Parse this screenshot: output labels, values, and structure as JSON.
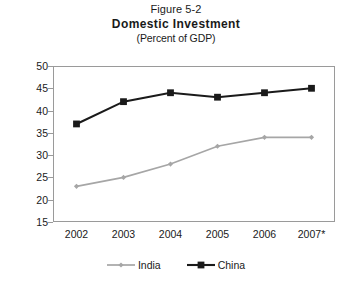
{
  "titles": {
    "figure_number": "Figure 5-2",
    "main": "Domestic Investment",
    "subtitle": "(Percent of GDP)"
  },
  "colors": {
    "india": "#a6a6a6",
    "china": "#1a1a1a",
    "frame": "#9a9a9a",
    "background": "#ffffff"
  },
  "chart_data": {
    "type": "line",
    "title": "Domestic Investment",
    "subtitle": "(Percent of GDP)",
    "figure_number": "Figure 5-2",
    "xlabel": "",
    "ylabel": "",
    "categories": [
      "2002",
      "2003",
      "2004",
      "2005",
      "2006",
      "2007*"
    ],
    "ylim": [
      15,
      50
    ],
    "yticks": [
      15,
      20,
      25,
      30,
      35,
      40,
      45,
      50
    ],
    "grid": false,
    "legend_position": "bottom",
    "series": [
      {
        "name": "India",
        "color": "#a6a6a6",
        "marker": "diamond",
        "values": [
          23,
          25,
          28,
          32,
          34,
          34
        ]
      },
      {
        "name": "China",
        "color": "#1a1a1a",
        "marker": "square",
        "values": [
          37,
          42,
          44,
          43,
          44,
          45
        ]
      }
    ]
  }
}
